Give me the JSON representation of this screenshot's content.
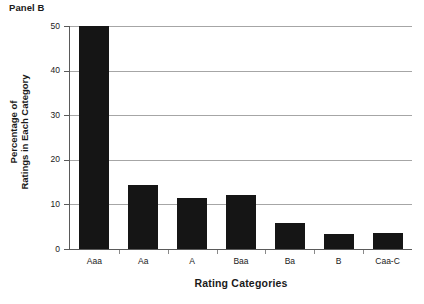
{
  "panel": {
    "title": "Panel B"
  },
  "chart_data": {
    "type": "bar",
    "title": "Panel B",
    "xlabel": "Rating Categories",
    "ylabel": "Percentage of Ratings in Each Category",
    "ylabel_lines": [
      "Percentage of",
      "Ratings in Each Category"
    ],
    "categories": [
      "Aaa",
      "Aa",
      "A",
      "Baa",
      "Ba",
      "B",
      "Caa-C"
    ],
    "values": [
      50.0,
      14.3,
      11.4,
      12.0,
      5.8,
      3.4,
      3.6
    ],
    "ylim": [
      0,
      50
    ],
    "yticks": [
      0,
      10,
      20,
      30,
      40,
      50
    ],
    "ytick_labels": [
      "0",
      "10",
      "20",
      "30",
      "40",
      "50"
    ],
    "grid": "horizontal",
    "legend": "none",
    "bar_color": "#151515",
    "gridline_color": "#a6a6a6",
    "axis_color": "#5a5a5a",
    "background_color": "#ffffff"
  }
}
